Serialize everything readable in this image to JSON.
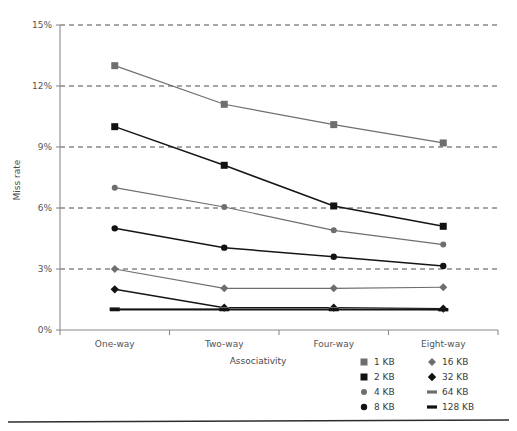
{
  "chart_data": {
    "type": "line",
    "title": "",
    "xlabel": "Associativity",
    "ylabel": "Miss rate",
    "categories": [
      "One-way",
      "Two-way",
      "Four-way",
      "Eight-way"
    ],
    "ylim": [
      0,
      15
    ],
    "yticks": [
      0,
      3,
      6,
      9,
      12,
      15
    ],
    "ytick_labels": [
      "0%",
      "3%",
      "6%",
      "9%",
      "12%",
      "15%"
    ],
    "grid": "horizontal-dashed",
    "legend_position": "bottom-right",
    "value_unit": "percent",
    "series": [
      {
        "name": "1 KB",
        "values": [
          13.0,
          11.1,
          10.1,
          9.2
        ],
        "color": "#6e6e6e",
        "marker": "square",
        "marker_size": 7
      },
      {
        "name": "2 KB",
        "values": [
          10.0,
          8.1,
          6.1,
          5.1
        ],
        "color": "#121212",
        "marker": "square",
        "marker_size": 7
      },
      {
        "name": "4 KB",
        "values": [
          7.0,
          6.05,
          4.9,
          4.2
        ],
        "color": "#6e6e6e",
        "marker": "circle",
        "marker_size": 3
      },
      {
        "name": "8 KB",
        "values": [
          5.0,
          4.05,
          3.6,
          3.15
        ],
        "color": "#121212",
        "marker": "circle",
        "marker_size": 3.2
      },
      {
        "name": "16 KB",
        "values": [
          3.0,
          2.05,
          2.05,
          2.1
        ],
        "color": "#6e6e6e",
        "marker": "diamond",
        "marker_size": 4
      },
      {
        "name": "32 KB",
        "values": [
          2.0,
          1.1,
          1.1,
          1.05
        ],
        "color": "#121212",
        "marker": "diamond",
        "marker_size": 4.2
      },
      {
        "name": "64 KB",
        "values": [
          1.05,
          1.05,
          1.05,
          1.0
        ],
        "color": "#6e6e6e",
        "marker": "dash",
        "marker_size": 5
      },
      {
        "name": "128 KB",
        "values": [
          1.0,
          1.0,
          1.0,
          1.0
        ],
        "color": "#121212",
        "marker": "dash",
        "marker_size": 5
      }
    ]
  },
  "legend": {
    "column_left": [
      "1 KB",
      "2 KB",
      "4 KB",
      "8 KB"
    ],
    "column_right": [
      "16 KB",
      "32 KB",
      "64 KB",
      "128 KB"
    ]
  },
  "colors": {
    "gray_series": "#6e6e6e",
    "black_series": "#121212",
    "gridline": "#4d4d4d",
    "axis": "#8a8a8a",
    "text": "#3a3a3a",
    "background": "#ffffff"
  }
}
